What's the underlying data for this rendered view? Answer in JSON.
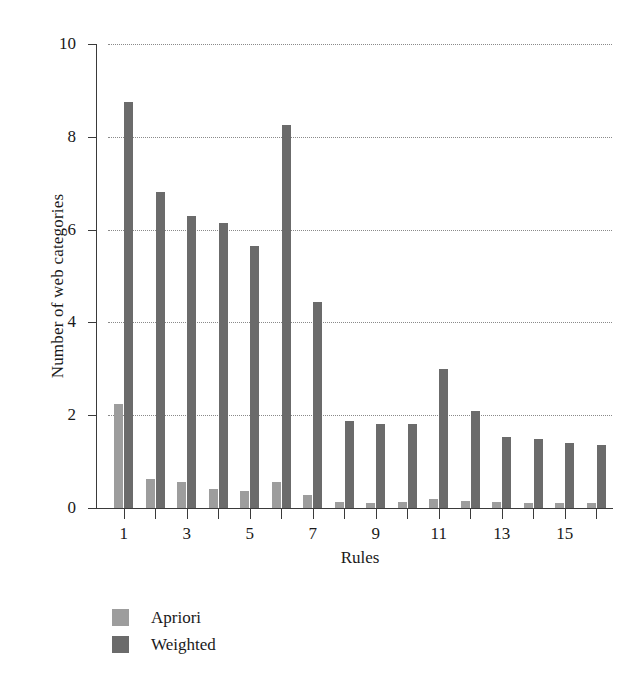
{
  "chart_data": {
    "type": "bar",
    "title": "",
    "xlabel": "Rules",
    "ylabel": "Number of web categories",
    "ylim": [
      0,
      10
    ],
    "yticks": [
      0,
      2,
      4,
      6,
      8,
      10
    ],
    "grid": true,
    "legend_position": "below-left",
    "categories": [
      "1",
      "2",
      "3",
      "4",
      "5",
      "6",
      "7",
      "8",
      "9",
      "10",
      "11",
      "12",
      "13",
      "14",
      "15",
      "16"
    ],
    "xtick_labels": [
      "1",
      "",
      "3",
      "",
      "5",
      "",
      "7",
      "",
      "9",
      "",
      "11",
      "",
      "13",
      "",
      "15",
      ""
    ],
    "series": [
      {
        "name": "Apriori",
        "color": "#9d9d9d",
        "values": [
          2.25,
          0.62,
          0.55,
          0.42,
          0.37,
          0.55,
          0.28,
          0.12,
          0.1,
          0.13,
          0.2,
          0.15,
          0.12,
          0.1,
          0.1,
          0.1
        ]
      },
      {
        "name": "Weighted",
        "color": "#6b6b6b",
        "values": [
          8.75,
          6.8,
          6.3,
          6.15,
          5.65,
          8.25,
          4.45,
          1.88,
          1.82,
          1.8,
          3.0,
          2.1,
          1.52,
          1.48,
          1.4,
          1.35
        ]
      }
    ]
  },
  "legend": {
    "items": [
      {
        "label": "Apriori",
        "color": "#9d9d9d"
      },
      {
        "label": "Weighted",
        "color": "#6b6b6b"
      }
    ]
  },
  "axes": {
    "y_title": "Number of web categories",
    "x_title": "Rules"
  }
}
